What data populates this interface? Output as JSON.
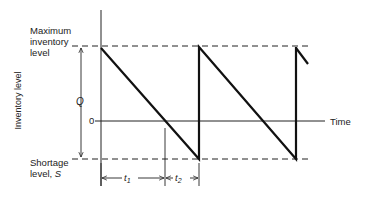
{
  "diagram": {
    "type": "inventory-sawtooth-with-shortages",
    "y_axis_label": "Inventory level",
    "x_axis_label": "Time",
    "zero_label": "0",
    "max_label_line1": "Maximum",
    "max_label_line2": "inventory",
    "max_label_line3": "level",
    "shortage_label_line1": "Shortage",
    "shortage_label_line2": "level, ",
    "shortage_symbol": "S",
    "q_label": "Q",
    "t1": {
      "base": "t",
      "sub": "1"
    },
    "t2": {
      "base": "t",
      "sub": "2"
    }
  },
  "geometry": {
    "axis_x": 101,
    "axis_top": 10,
    "axis_bottom": 186,
    "max_y": 46,
    "zero_y": 121,
    "shortage_y": 159,
    "cycle_starts_x": [
      101,
      198,
      295
    ],
    "t1_end_x": 165,
    "t2_end_x": 199,
    "dim_y": 178
  },
  "colors": {
    "ink": "#222222",
    "background": "#ffffff"
  }
}
